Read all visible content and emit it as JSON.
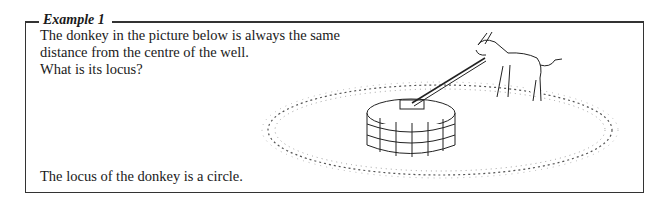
{
  "example": {
    "title": "Example 1",
    "question_lines": [
      "The donkey in the picture below is always the same",
      "distance from the centre of the well.",
      "What is its locus?"
    ],
    "answer": "The locus of the donkey is a circle."
  },
  "illustration": {
    "subject": "donkey tethered to well walking in circular path",
    "colors": {
      "line": "#222222",
      "border": "#333333"
    }
  }
}
